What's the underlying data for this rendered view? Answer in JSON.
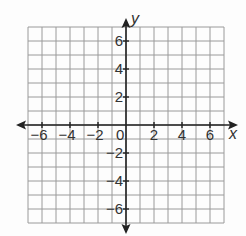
{
  "chart_data": {
    "type": "coordinate-grid",
    "title": "",
    "xlabel": "x",
    "ylabel": "y",
    "xlim": [
      -7,
      7
    ],
    "ylim": [
      -7,
      7
    ],
    "grid": true,
    "grid_step": 1,
    "x_ticks": [
      -6,
      -4,
      -2,
      2,
      4,
      6
    ],
    "y_ticks": [
      6,
      4,
      2,
      -2,
      -4,
      -6
    ],
    "x_tick_labels": [
      "−6",
      "−4",
      "−2",
      "2",
      "4",
      "6"
    ],
    "y_tick_labels": [
      "6",
      "4",
      "2",
      "−2",
      "−4",
      "−6"
    ],
    "origin_label": "0",
    "series": []
  },
  "colors": {
    "grid": "#9a9a9a",
    "axis": "#222222",
    "text": "#333333",
    "background": "#fdfdfd"
  }
}
